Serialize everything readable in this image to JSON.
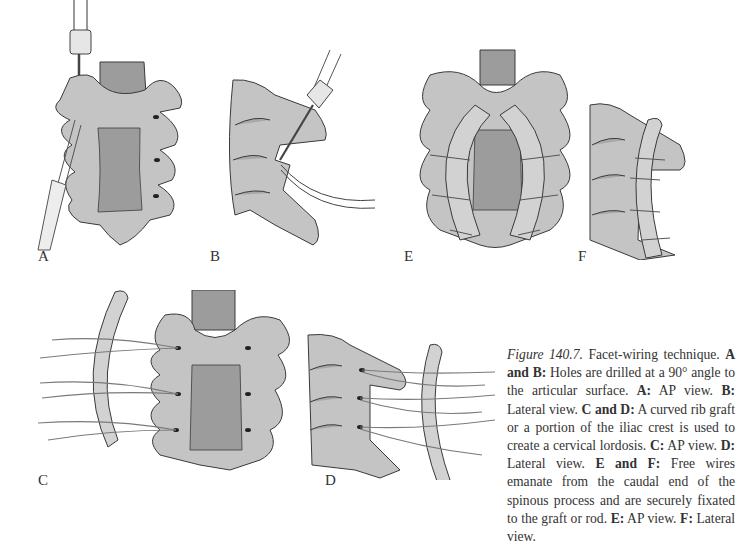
{
  "figure": {
    "number_label": "Figure 140.7.",
    "title": "Facet-wiring technique.",
    "caption_segments": [
      {
        "bold": "A and B:",
        "text": " Holes are drilled at a 90° angle to the articular surface. "
      },
      {
        "bold": "A:",
        "text": " AP view. "
      },
      {
        "bold": "B:",
        "text": " Lateral view. "
      },
      {
        "bold": "C and D:",
        "text": " A curved rib graft or a portion of the iliac crest is used to create a cervical lordosis. "
      },
      {
        "bold": "C:",
        "text": " AP view. "
      },
      {
        "bold": "D:",
        "text": " Lateral view. "
      },
      {
        "bold": "E and F:",
        "text": " Free wires emanate from the caudal end of the spinous process and are securely fixated to the graft or rod. "
      },
      {
        "bold": "E:",
        "text": " AP view. "
      },
      {
        "bold": "F:",
        "text": " Lateral view."
      }
    ]
  },
  "panels": [
    {
      "id": "A",
      "label": "A",
      "view": "AP view",
      "description": "Drill making holes at 90° to articular surface"
    },
    {
      "id": "B",
      "label": "B",
      "view": "Lateral view",
      "description": "Drill and wire passed through facet"
    },
    {
      "id": "C",
      "label": "C",
      "view": "AP view",
      "description": "Curved rib graft with wires from facets"
    },
    {
      "id": "D",
      "label": "D",
      "view": "Lateral view",
      "description": "Rib graft with wires from lateral facets"
    },
    {
      "id": "E",
      "label": "E",
      "view": "AP view",
      "description": "Bilateral grafts wired to facets"
    },
    {
      "id": "F",
      "label": "F",
      "view": "Lateral view",
      "description": "Graft wired along lateral spine"
    }
  ],
  "colors": {
    "bone": "#c4c4c4",
    "cord": "#9c9c9c",
    "outline": "#3a3a3a",
    "graft": "#cfcfcf",
    "wire": "#7a7a7a",
    "text": "#333333"
  }
}
